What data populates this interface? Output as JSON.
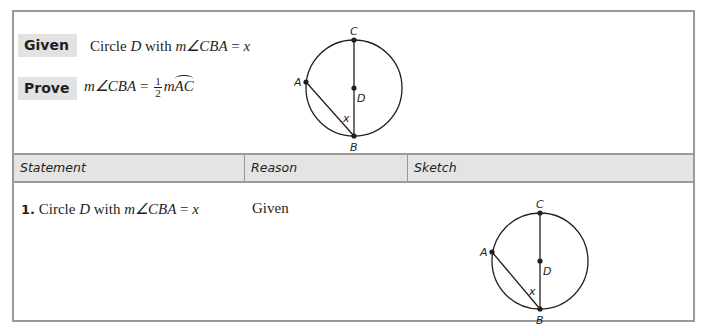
{
  "given": {
    "label": "Given",
    "prefix": "Circle ",
    "circle_name": "D",
    "mid": " with ",
    "expr": "m∠CBA",
    "eq": " = ",
    "value": "x"
  },
  "prove": {
    "label": "Prove",
    "lhs": "m∠CBA",
    "eq": " = ",
    "frac_num": "1",
    "frac_den": "2",
    "rhs_m": "m",
    "rhs_arc": "AC"
  },
  "figure": {
    "points": {
      "C": "C",
      "A": "A",
      "D": "D",
      "B": "B",
      "angle": "x"
    }
  },
  "table": {
    "headers": [
      "Statement",
      "Reason",
      "Sketch"
    ],
    "rows": [
      {
        "number": "1.",
        "statement_prefix": "Circle ",
        "statement_circle": "D",
        "statement_mid": " with ",
        "statement_expr": "m∠CBA",
        "statement_eq": " = ",
        "statement_value": "x",
        "reason": "Given"
      }
    ]
  },
  "colors": {
    "border": "#9a9a9a",
    "label_bg": "#e2e2e2",
    "header_bg": "#e4e4e4",
    "text": "#231f20"
  }
}
